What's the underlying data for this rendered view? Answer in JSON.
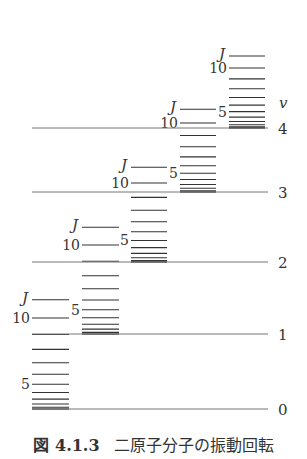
{
  "figure": {
    "caption_number": "図 4.1.3",
    "caption_text": "二原子分子の振動回転",
    "axis_label": "v",
    "rot_label": "J",
    "line_color": "#333333",
    "thin_line_color": "#777777"
  },
  "chart_data": {
    "type": "energy-level-diagram",
    "title": "二原子分子の振動回転",
    "vibrational_axis_label": "v",
    "rotational_axis_label": "J",
    "vib_levels": [
      {
        "v": 0,
        "y": 409,
        "label": "0",
        "col_x": [
          32,
          69
        ],
        "j10_gap": 91,
        "labels": [
          "5",
          "10",
          "J"
        ]
      },
      {
        "v": 1,
        "y": 334,
        "label": "1",
        "col_x": [
          82,
          119
        ],
        "j10_gap": 89,
        "labels": [
          "5",
          "10",
          "J"
        ]
      },
      {
        "v": 2,
        "y": 262,
        "label": "2",
        "col_x": [
          131,
          167
        ],
        "j10_gap": 79,
        "labels": [
          "5",
          "10",
          "J"
        ]
      },
      {
        "v": 3,
        "y": 192,
        "label": "3",
        "col_x": [
          180,
          216
        ],
        "j10_gap": 69,
        "labels": [
          "5",
          "10",
          "J"
        ]
      },
      {
        "v": 4,
        "y": 128,
        "label": "4",
        "col_x": [
          229,
          265
        ],
        "j10_gap": 60,
        "labels": [
          "5",
          "10",
          "J"
        ]
      }
    ],
    "rotational_J_range": [
      0,
      11
    ],
    "line_x_range": [
      32,
      268
    ]
  }
}
